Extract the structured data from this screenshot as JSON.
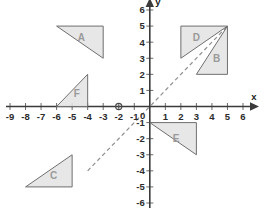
{
  "diagram": {
    "kind": "cartesian-coordinate-plane",
    "axes": {
      "x": {
        "name": "x",
        "min": -9,
        "max": 6,
        "ticks": [
          -9,
          -8,
          -7,
          -6,
          -5,
          -4,
          -3,
          -2,
          -1,
          1,
          2,
          3,
          4,
          5,
          6
        ],
        "tick_labels": [
          "-9",
          "-8",
          "-7",
          "-6",
          "-5",
          "-4",
          "-3",
          "-2",
          "-1",
          "1",
          "2",
          "3",
          "4",
          "5",
          "6"
        ]
      },
      "y": {
        "name": "y",
        "min": -6,
        "max": 6,
        "ticks": [
          6,
          5,
          4,
          3,
          2,
          1,
          -1,
          -2,
          -3,
          -4,
          -5,
          -6
        ],
        "tick_labels": [
          "6",
          "5",
          "4",
          "3",
          "2",
          "1",
          "-1",
          "-2",
          "-3",
          "-4",
          "-5",
          "-6"
        ]
      },
      "origin_label": "0"
    },
    "mirror_line": {
      "name": "line-y-equals-x",
      "from": [
        -4,
        -4
      ],
      "to": [
        5,
        5
      ],
      "style": "dashed"
    },
    "point_marker": {
      "name": "circle-marker",
      "at": [
        -2,
        0
      ]
    },
    "shapes": [
      {
        "label": "A",
        "vertices": [
          [
            -6,
            5
          ],
          [
            -3,
            5
          ],
          [
            -3,
            3
          ]
        ],
        "label_at": [
          -4.4,
          4.3
        ]
      },
      {
        "label": "B",
        "vertices": [
          [
            5,
            5
          ],
          [
            3,
            2
          ],
          [
            5,
            2
          ]
        ],
        "label_at": [
          4.3,
          3.0
        ]
      },
      {
        "label": "C",
        "vertices": [
          [
            -8,
            -5
          ],
          [
            -5,
            -5
          ],
          [
            -5,
            -3
          ]
        ],
        "label_at": [
          -6.2,
          -4.3
        ]
      },
      {
        "label": "D",
        "vertices": [
          [
            5,
            5
          ],
          [
            2,
            5
          ],
          [
            2,
            3
          ]
        ],
        "label_at": [
          3.0,
          4.3
        ]
      },
      {
        "label": "E",
        "vertices": [
          [
            0,
            -1
          ],
          [
            3,
            -1
          ],
          [
            3,
            -3
          ]
        ],
        "label_at": [
          1.7,
          -2.0
        ]
      },
      {
        "label": "F",
        "vertices": [
          [
            -6,
            0
          ],
          [
            -4,
            0
          ],
          [
            -4,
            2
          ]
        ],
        "label_at": [
          -4.7,
          0.8
        ]
      }
    ],
    "colors": {
      "shape_fill": "#e3e3e3",
      "shape_stroke": "#6f6f6f",
      "axis": "#3a3a3a",
      "mirror": "#8e8e8e",
      "label_text": "#9a9a9a",
      "tick_text": "#2b2b2b"
    }
  }
}
